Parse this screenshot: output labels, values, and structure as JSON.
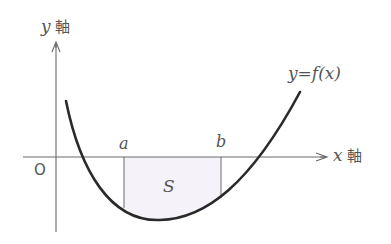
{
  "diagram": {
    "type": "function-graph-area",
    "colors": {
      "background": "#ffffff",
      "axis": "#6a6a6a",
      "curve": "#2a2a2a",
      "shading": "#f6f2fa",
      "text": "#555555"
    },
    "labels": {
      "y_axis_var": "y",
      "y_axis_word": "軸",
      "x_axis_var": "x",
      "x_axis_word": "軸",
      "origin": "O",
      "a": "a",
      "b": "b",
      "area": "S",
      "curve": "y=f(x)"
    },
    "geometry": {
      "y_axis": {
        "x": 56,
        "y_top": 42,
        "y_bottom": 232
      },
      "x_axis": {
        "y": 157,
        "x_left": 23,
        "x_right": 327
      },
      "a_x": 124,
      "b_x": 221,
      "curve_path": "M66,101 C80,170 110,222 160,220 C205,219 250,185 300,92",
      "area_path": "M124,157 L124,208 C140,218 150,220 160,220 C185,220 205,210 221,198 L221,157 Z"
    }
  }
}
